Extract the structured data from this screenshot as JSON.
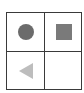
{
  "grid": {
    "rows": 2,
    "cols": 2,
    "border_color": "#3a3a3a",
    "cells": [
      {
        "shape": "circle",
        "color": "#6b6b6b"
      },
      {
        "shape": "square",
        "color": "#7a7a7a"
      },
      {
        "shape": "triangle-left",
        "color": "#bdbdbd"
      },
      {
        "shape": "empty",
        "color": ""
      }
    ]
  }
}
